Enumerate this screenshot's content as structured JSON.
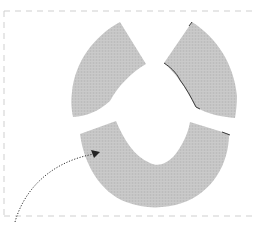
{
  "diagram": {
    "colors": {
      "fabric": "#c4c4c4",
      "fabric_shade": "#b8b8b8",
      "edge": "#3a3a3a",
      "border": "#cfcfcf",
      "arrow": "#333333",
      "background": "#ffffff"
    },
    "pieces": [
      {
        "id": "top-left",
        "label": ""
      },
      {
        "id": "top-right",
        "label": ""
      },
      {
        "id": "bottom",
        "label": ""
      }
    ],
    "arrow": {
      "style": "dotted",
      "from": [
        15,
        222
      ],
      "to": [
        98,
        152
      ]
    }
  }
}
